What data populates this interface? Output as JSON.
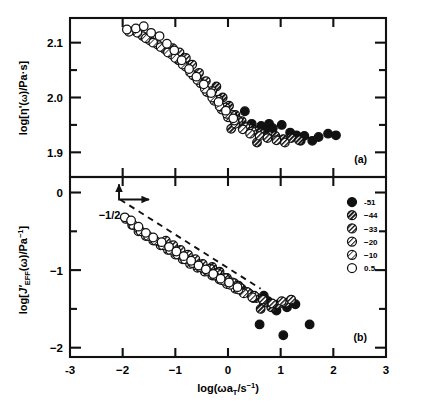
{
  "figure": {
    "panel_a_label": "(a)",
    "panel_b_label": "(b)",
    "slope_annotation": "−1/2",
    "caption": ""
  },
  "axes": {
    "x": {
      "label_main": "log(ωa",
      "label_sub": "T",
      "label_mid": "/s",
      "label_sup": "−1",
      "label_end": ")",
      "ticks": [
        "-3",
        "−2",
        "−1",
        "0",
        "1",
        "2",
        "3"
      ],
      "min": -3,
      "max": 3
    },
    "y_a": {
      "label_p1": "log[η'(",
      "label_p2": "ω",
      "label_p3": ")/Pa·s]",
      "ticks": [
        "2.1",
        "2.0",
        "1.9"
      ],
      "min": 1.855,
      "max": 2.145
    },
    "y_b": {
      "label_p1": "log[",
      "label_p2": "J'",
      "label_p3": "EFF",
      "label_p4": "(ω)/Pa",
      "label_p5": "−1",
      "label_p6": "]",
      "ticks": [
        "0",
        "−1",
        "−2"
      ],
      "min": -2.12,
      "max": 0.2
    }
  },
  "legend": {
    "entries": [
      {
        "label": "-51",
        "style": "solid"
      },
      {
        "label": "−44",
        "style": "hatch-dense"
      },
      {
        "label": "−33",
        "style": "hatch-medium"
      },
      {
        "label": "−20",
        "style": "hatch-light"
      },
      {
        "label": "−10",
        "style": "hatch-sparse"
      },
      {
        "label": "0.5",
        "style": "open"
      }
    ]
  },
  "colors": {
    "ink": "#111111",
    "frame": "#111111",
    "marker_fill_open": "#ffffff",
    "marker_fill_solid": "#111111"
  },
  "chart_data": {
    "type": "scatter",
    "title": "",
    "xlabel": "log(ωa_T/s^-1)",
    "xlim": [
      -3,
      3
    ],
    "grid": false,
    "legend_position": "right-middle-panel-b",
    "annotations": [
      {
        "text": "−1/2",
        "panel": "b",
        "x": -2.25,
        "y": -0.34,
        "type": "slope-guide",
        "slope": -0.5,
        "line_from": [
          -2.05,
          -0.09
        ],
        "line_to": [
          0.62,
          -1.24
        ]
      }
    ],
    "panels": [
      {
        "id": "a",
        "label": "(a)",
        "ylabel": "log[η'(ω)/Pa·s]",
        "ylim": [
          1.855,
          2.145
        ],
        "yticks": [
          2.1,
          2.0,
          1.9
        ],
        "yticks_minor": [
          2.05,
          1.95
        ],
        "series": [
          {
            "name": "-51",
            "style": "solid",
            "points": [
              [
                0.32,
                1.975
              ],
              [
                0.45,
                1.952
              ],
              [
                0.63,
                1.948
              ],
              [
                0.78,
                1.952
              ],
              [
                0.85,
                1.944
              ],
              [
                1.02,
                1.95
              ],
              [
                1.18,
                1.936
              ],
              [
                1.3,
                1.931
              ],
              [
                1.45,
                1.93
              ],
              [
                1.6,
                1.921
              ],
              [
                1.72,
                1.928
              ],
              [
                1.9,
                1.934
              ],
              [
                2.05,
                1.931
              ],
              [
                0.7,
                1.94
              ],
              [
                1.38,
                1.921
              ]
            ]
          },
          {
            "name": "-44",
            "style": "hatch-dense",
            "points": [
              [
                -0.22,
                2.02
              ],
              [
                -0.1,
                2.0
              ],
              [
                0.02,
                1.985
              ],
              [
                0.14,
                1.968
              ],
              [
                0.26,
                1.957
              ],
              [
                0.38,
                1.946
              ],
              [
                0.5,
                1.94
              ],
              [
                0.62,
                1.935
              ],
              [
                0.74,
                1.928
              ],
              [
                0.9,
                1.93
              ],
              [
                1.05,
                1.924
              ],
              [
                1.2,
                1.926
              ],
              [
                1.35,
                1.922
              ],
              [
                0.06,
                1.943
              ],
              [
                0.55,
                1.918
              ]
            ]
          },
          {
            "name": "-33",
            "style": "hatch-medium",
            "points": [
              [
                -1.05,
                2.09
              ],
              [
                -0.92,
                2.082
              ],
              [
                -0.8,
                2.072
              ],
              [
                -0.68,
                2.06
              ],
              [
                -0.55,
                2.045
              ],
              [
                -0.42,
                2.03
              ],
              [
                -0.3,
                2.012
              ],
              [
                -0.18,
                1.996
              ],
              [
                -0.05,
                1.982
              ],
              [
                0.08,
                1.968
              ],
              [
                0.2,
                1.957
              ],
              [
                0.33,
                1.946
              ],
              [
                0.46,
                1.938
              ],
              [
                0.6,
                1.93
              ],
              [
                0.75,
                1.926
              ],
              [
                0.92,
                1.922
              ],
              [
                1.08,
                1.918
              ]
            ]
          },
          {
            "name": "-20",
            "style": "hatch-light",
            "points": [
              [
                -1.78,
                2.122
              ],
              [
                -1.62,
                2.112
              ],
              [
                -1.48,
                2.104
              ],
              [
                -1.33,
                2.096
              ],
              [
                -1.2,
                2.088
              ],
              [
                -1.06,
                2.078
              ],
              [
                -0.94,
                2.068
              ],
              [
                -0.8,
                2.056
              ],
              [
                -0.66,
                2.04
              ],
              [
                -0.52,
                2.026
              ],
              [
                -0.4,
                2.01
              ],
              [
                -0.26,
                1.994
              ],
              [
                -0.12,
                1.978
              ],
              [
                0.0,
                1.964
              ],
              [
                0.14,
                1.952
              ],
              [
                0.28,
                1.942
              ],
              [
                0.42,
                1.934
              ]
            ]
          },
          {
            "name": "-10",
            "style": "hatch-sparse",
            "points": [
              [
                -1.88,
                2.12
              ],
              [
                -1.72,
                2.118
              ],
              [
                -1.56,
                2.108
              ],
              [
                -1.42,
                2.1
              ],
              [
                -1.28,
                2.092
              ],
              [
                -1.14,
                2.082
              ],
              [
                -1.0,
                2.072
              ],
              [
                -0.86,
                2.06
              ],
              [
                -0.72,
                2.046
              ],
              [
                -0.58,
                2.032
              ],
              [
                -0.44,
                2.016
              ],
              [
                -0.3,
                2.0
              ],
              [
                -0.16,
                1.984
              ],
              [
                -0.02,
                1.97
              ],
              [
                0.12,
                1.958
              ]
            ]
          },
          {
            "name": "0.5",
            "style": "open",
            "points": [
              [
                -1.92,
                2.124
              ],
              [
                -1.75,
                2.126
              ],
              [
                -1.6,
                2.13
              ],
              [
                -1.46,
                2.118
              ],
              [
                -1.3,
                2.112
              ],
              [
                -1.16,
                2.098
              ],
              [
                -1.02,
                2.086
              ],
              [
                -0.88,
                2.068
              ],
              [
                -0.74,
                2.052
              ],
              [
                -0.6,
                2.038
              ],
              [
                -0.46,
                2.024
              ],
              [
                -0.32,
                2.008
              ],
              [
                -0.18,
                1.992
              ],
              [
                -0.04,
                1.976
              ],
              [
                0.1,
                1.962
              ]
            ]
          }
        ]
      },
      {
        "id": "b",
        "label": "(b)",
        "ylabel": "log[J'_EFF(ω)/Pa^-1]",
        "ylim": [
          -2.12,
          0.2
        ],
        "yticks": [
          0,
          -1,
          -2
        ],
        "yticks_minor": [
          -0.5,
          -1.5
        ],
        "series": [
          {
            "name": "-51",
            "style": "solid",
            "points": [
              [
                0.3,
                -1.28
              ],
              [
                0.48,
                -1.36
              ],
              [
                0.6,
                -1.7
              ],
              [
                0.76,
                -1.4
              ],
              [
                0.92,
                -1.52
              ],
              [
                1.05,
                -1.84
              ],
              [
                1.12,
                -1.48
              ],
              [
                1.28,
                -1.44
              ],
              [
                1.55,
                -1.7
              ],
              [
                0.68,
                -1.33
              ]
            ]
          },
          {
            "name": "-44",
            "style": "hatch-dense",
            "points": [
              [
                -0.3,
                -0.96
              ],
              [
                -0.16,
                -1.02
              ],
              [
                -0.02,
                -1.1
              ],
              [
                0.12,
                -1.17
              ],
              [
                0.26,
                -1.24
              ],
              [
                0.4,
                -1.3
              ],
              [
                0.54,
                -1.36
              ],
              [
                0.68,
                -1.42
              ],
              [
                0.82,
                -1.48
              ],
              [
                0.96,
                -1.44
              ],
              [
                1.1,
                -1.42
              ],
              [
                0.2,
                -1.2
              ],
              [
                0.62,
                -1.5
              ]
            ]
          },
          {
            "name": "-33",
            "style": "hatch-medium",
            "points": [
              [
                -1.18,
                -0.62
              ],
              [
                -1.04,
                -0.68
              ],
              [
                -0.9,
                -0.74
              ],
              [
                -0.76,
                -0.8
              ],
              [
                -0.62,
                -0.86
              ],
              [
                -0.48,
                -0.92
              ],
              [
                -0.34,
                -0.98
              ],
              [
                -0.2,
                -1.04
              ],
              [
                -0.06,
                -1.1
              ],
              [
                0.08,
                -1.16
              ],
              [
                0.22,
                -1.22
              ],
              [
                0.36,
                -1.28
              ],
              [
                0.5,
                -1.33
              ],
              [
                0.66,
                -1.38
              ],
              [
                0.84,
                -1.43
              ],
              [
                1.02,
                -1.4
              ],
              [
                1.2,
                -1.38
              ]
            ]
          },
          {
            "name": "-20",
            "style": "hatch-light",
            "points": [
              [
                -1.82,
                -0.42
              ],
              [
                -1.7,
                -0.5
              ],
              [
                -1.56,
                -0.56
              ],
              [
                -1.42,
                -0.62
              ],
              [
                -1.28,
                -0.68
              ],
              [
                -1.14,
                -0.74
              ],
              [
                -1.0,
                -0.8
              ],
              [
                -0.86,
                -0.86
              ],
              [
                -0.72,
                -0.92
              ],
              [
                -0.58,
                -0.97
              ],
              [
                -0.44,
                -1.02
              ],
              [
                -0.3,
                -1.07
              ],
              [
                -0.16,
                -1.12
              ],
              [
                -0.02,
                -1.18
              ],
              [
                0.14,
                -1.24
              ],
              [
                0.3,
                -1.3
              ],
              [
                0.46,
                -1.35
              ]
            ]
          },
          {
            "name": "-10",
            "style": "hatch-sparse",
            "points": [
              [
                -1.94,
                -0.34
              ],
              [
                -1.8,
                -0.42
              ],
              [
                -1.66,
                -0.5
              ],
              [
                -1.52,
                -0.56
              ],
              [
                -1.38,
                -0.62
              ],
              [
                -1.24,
                -0.68
              ],
              [
                -1.1,
                -0.74
              ],
              [
                -0.96,
                -0.8
              ],
              [
                -0.82,
                -0.86
              ],
              [
                -0.68,
                -0.91
              ],
              [
                -0.54,
                -0.96
              ],
              [
                -0.4,
                -1.01
              ],
              [
                -0.26,
                -1.07
              ],
              [
                -0.12,
                -1.13
              ],
              [
                0.04,
                -1.19
              ],
              [
                0.2,
                -1.25
              ]
            ]
          },
          {
            "name": "0.5",
            "style": "open",
            "points": [
              [
                -1.96,
                -0.32
              ],
              [
                -1.84,
                -0.36
              ],
              [
                -1.7,
                -0.44
              ],
              [
                -1.56,
                -0.52
              ],
              [
                -1.42,
                -0.58
              ],
              [
                -1.26,
                -0.64
              ],
              [
                -1.12,
                -0.7
              ],
              [
                -0.98,
                -0.76
              ],
              [
                -0.84,
                -0.82
              ],
              [
                -0.7,
                -0.88
              ],
              [
                -0.56,
                -0.94
              ],
              [
                -0.42,
                -0.99
              ],
              [
                -0.28,
                -1.05
              ],
              [
                -0.14,
                -1.11
              ],
              [
                0.02,
                -1.16
              ],
              [
                0.18,
                -1.22
              ]
            ]
          }
        ]
      }
    ]
  }
}
